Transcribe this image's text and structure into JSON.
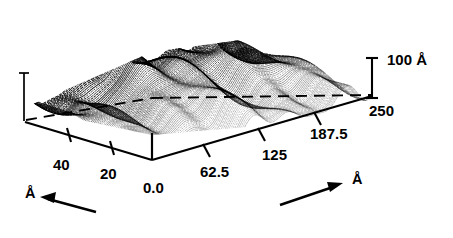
{
  "figure": {
    "kind": "3d-surface-topograph",
    "background_color": "#ffffff",
    "ink_color": "#000000"
  },
  "chart_data": {
    "type": "line",
    "title": "",
    "subtitle": "",
    "projection": "3d-surface-mesh",
    "xlabel": "Å",
    "ylabel": "Å",
    "zlabel": "100 Å",
    "x_axis": {
      "name": "front-right-axis",
      "tick_labels": [
        "0.0",
        "62.5",
        "125",
        "187.5",
        "250"
      ],
      "tick_values": [
        0.0,
        62.5,
        125,
        187.5,
        250
      ],
      "unit": "Å",
      "range": [
        0,
        250
      ],
      "grid": false
    },
    "y_axis": {
      "name": "front-left-axis",
      "tick_labels": [
        "0.0",
        "20",
        "40"
      ],
      "tick_values": [
        0,
        20,
        40
      ],
      "unit": "Å",
      "range": [
        0,
        50
      ],
      "grid": false
    },
    "z_axis": {
      "name": "vertical-scale-bar",
      "label": "100 Å",
      "value": 100,
      "unit": "Å",
      "range": [
        0,
        100
      ]
    },
    "legend": {
      "entries": [],
      "position": "none"
    },
    "annotations": [
      {
        "name": "x-unit-arrow",
        "text": "Å",
        "direction": "up-right"
      },
      {
        "name": "y-unit-arrow",
        "text": "Å",
        "direction": "left"
      }
    ],
    "series": [
      {
        "name": "surface-trace-profiles",
        "style": "dense-hatched-line-mesh",
        "n_traces": 96,
        "ridge_orientation": "along-x",
        "corrugation_amplitude_angstrom": 100,
        "note": "Each trace is one scan line; amplitude values are qualitative corrugation read from the z scale bar."
      }
    ]
  },
  "axis_labels": {
    "origin": "0.0",
    "x_62_5": "62.5",
    "x_125": "125",
    "x_187_5": "187.5",
    "x_250": "250",
    "y_20": "20",
    "y_40": "40",
    "z_height": "100 Å",
    "unit_x": "Å",
    "unit_y": "Å"
  }
}
